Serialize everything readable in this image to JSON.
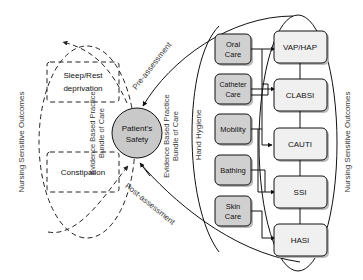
{
  "diagram": {
    "center_node": {
      "line1": "Patient's",
      "line2": "Safety",
      "fill": "#c9c9c9",
      "stroke": "#111111"
    },
    "left_group": {
      "axis_label": "Nursing Sensitive Outcomes",
      "bundle_label_line1": "Evidence Based Practice",
      "bundle_label_line2": "Bundle of Care",
      "items": [
        {
          "id": "sleep-rest-deprivation",
          "line1": "Sleep/Rest",
          "line2": "deprivation"
        },
        {
          "id": "constipation",
          "line1": "Constipation",
          "line2": ""
        }
      ]
    },
    "right_group": {
      "axis_label": "Nursing Sensitive Outcomes",
      "bundle_label_line1": "Evidence Based Practice",
      "bundle_label_line2": "Bundle of Care",
      "hand_hygiene_label": "Hand Hygiene",
      "interventions": [
        {
          "id": "oral-care",
          "line1": "Oral",
          "line2": "Care"
        },
        {
          "id": "catheter-care",
          "line1": "Catheter",
          "line2": "Care"
        },
        {
          "id": "mobility",
          "line1": "Mobility",
          "line2": ""
        },
        {
          "id": "bathing",
          "line1": "Bathing",
          "line2": ""
        },
        {
          "id": "skin-care",
          "line1": "Skin",
          "line2": "Care"
        }
      ],
      "outcomes": [
        {
          "id": "vap-hap",
          "label": "VAP/HAP"
        },
        {
          "id": "clabsi",
          "label": "CLABSI"
        },
        {
          "id": "cauti",
          "label": "CAUTI"
        },
        {
          "id": "ssi",
          "label": "SSI"
        },
        {
          "id": "hasi",
          "label": "HASI"
        }
      ]
    },
    "assessment_labels": {
      "pre": "Pre-assessment",
      "post": "Post-assessment"
    },
    "colors": {
      "intervention_fill": "#d0d0d0",
      "outcome_fill": "#f0f0f0",
      "center_fill": "#c9c9c9",
      "stroke": "#111111",
      "shadow": "#b9b9b9",
      "text": "#111111"
    }
  }
}
